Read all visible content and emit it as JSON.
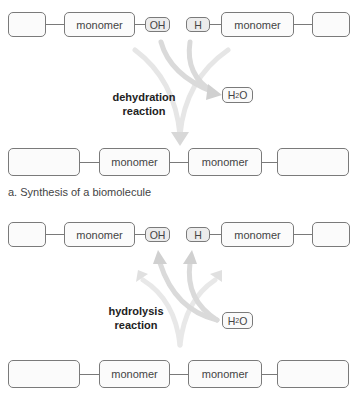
{
  "synthesis": {
    "top_row": {
      "left_monomer": "monomer",
      "oh_group": "OH",
      "h_group": "H",
      "right_monomer": "monomer"
    },
    "reaction_label_line1": "dehydration",
    "reaction_label_line2": "reaction",
    "water": "H2O",
    "bottom_row": {
      "monomer1": "monomer",
      "monomer2": "monomer"
    },
    "caption": "a. Synthesis of a biomolecule"
  },
  "hydrolysis": {
    "top_row": {
      "left_monomer": "monomer",
      "oh_group": "OH",
      "h_group": "H",
      "right_monomer": "monomer"
    },
    "reaction_label_line1": "hydrolysis",
    "reaction_label_line2": "reaction",
    "water": "H2O",
    "bottom_row": {
      "monomer1": "monomer",
      "monomer2": "monomer"
    }
  },
  "colors": {
    "border": "#7a7a7a",
    "arrow": "#d9d9d9",
    "small_box_fill": "#ececec"
  }
}
